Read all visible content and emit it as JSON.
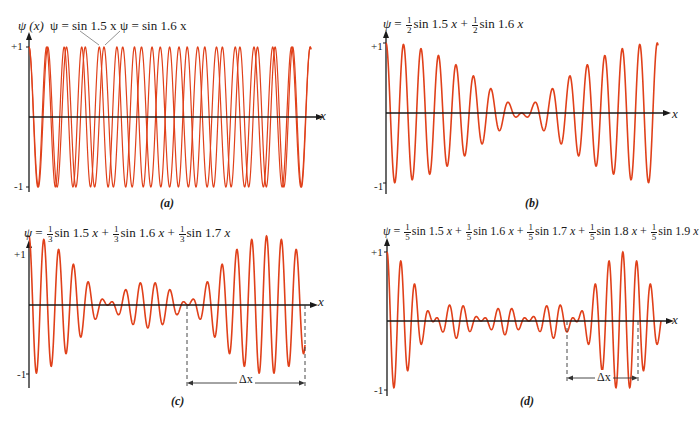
{
  "chart_data": [
    {
      "id": "a",
      "type": "line",
      "caption": "(a)",
      "title": "ψ = sin 1.5 x  and  ψ = sin 1.6 x (overlaid)",
      "ylabel": "ψ (x)",
      "xlabel": "x",
      "yticks": [
        "+1",
        "-1"
      ],
      "ylim": [
        -1,
        1
      ],
      "annotations": [
        "ψ = sin 1.5 x",
        "ψ = sin 1.6 x"
      ],
      "series": [
        {
          "name": "ψ = sin 1.5 x",
          "amplitudes": [
            1
          ],
          "wavenumbers": [
            1.5
          ]
        },
        {
          "name": "ψ = sin 1.6 x",
          "amplitudes": [
            1
          ],
          "wavenumbers": [
            1.6
          ]
        }
      ],
      "x_range": [
        0,
        63
      ],
      "color": "#e0401a",
      "grid": false
    },
    {
      "id": "b",
      "type": "line",
      "caption": "(b)",
      "title": "ψ = ½ sin 1.5 x + ½ sin 1.6 x",
      "xlabel": "x",
      "yticks": [
        "+1",
        "-1"
      ],
      "ylim": [
        -1,
        1
      ],
      "series": [
        {
          "name": "ψ",
          "amplitudes": [
            0.5,
            0.5
          ],
          "wavenumbers": [
            1.5,
            1.6
          ]
        }
      ],
      "x_range": [
        0,
        63
      ],
      "color": "#e0401a",
      "grid": false
    },
    {
      "id": "c",
      "type": "line",
      "caption": "(c)",
      "title": "ψ = ⅓ sin 1.5 x + ⅓ sin 1.6 x + ⅓ sin 1.7 x",
      "xlabel": "x",
      "yticks": [
        "+1",
        "-1"
      ],
      "ylim": [
        -1,
        1
      ],
      "series": [
        {
          "name": "ψ",
          "amplitudes": [
            0.3333,
            0.3333,
            0.3333
          ],
          "wavenumbers": [
            1.5,
            1.6,
            1.7
          ]
        }
      ],
      "x_range": [
        0,
        73
      ],
      "annotations": [
        "Δx"
      ],
      "color": "#e0401a",
      "grid": false
    },
    {
      "id": "d",
      "type": "line",
      "caption": "(d)",
      "title": "ψ = ⅕ sin 1.5 x + ⅕ sin 1.6 x + ⅕ sin 1.7 x + ⅕ sin 1.8 x + ⅕ sin 1.9 x",
      "xlabel": "x",
      "yticks": [
        "+1",
        "-1"
      ],
      "ylim": [
        -1,
        1
      ],
      "series": [
        {
          "name": "ψ",
          "amplitudes": [
            0.2,
            0.2,
            0.2,
            0.2,
            0.2
          ],
          "wavenumbers": [
            1.5,
            1.6,
            1.7,
            1.8,
            1.9
          ]
        }
      ],
      "x_range": [
        0,
        73
      ],
      "annotations": [
        "Δx"
      ],
      "color": "#e0401a",
      "grid": false
    }
  ],
  "labels": {
    "psi_x": "ψ (x)",
    "psi": "ψ",
    "eq": "=",
    "plus": "+",
    "x": "x",
    "plus_one": "+1",
    "minus_one": "-1",
    "delta_x": "Δx",
    "a_ann1": "ψ = sin 1.5 x",
    "a_ann2": "ψ = sin 1.6 x",
    "cap_a": "(a)",
    "cap_b": "(b)",
    "cap_c": "(c)",
    "cap_d": "(d)",
    "half": {
      "num": "1",
      "den": "2"
    },
    "third": {
      "num": "1",
      "den": "3"
    },
    "fifth": {
      "num": "1",
      "den": "5"
    },
    "sin15": "sin 1.5",
    "sin16": "sin 1.6",
    "sin17": "sin 1.7",
    "sin18": "sin 1.8",
    "sin19": "sin 1.9"
  }
}
